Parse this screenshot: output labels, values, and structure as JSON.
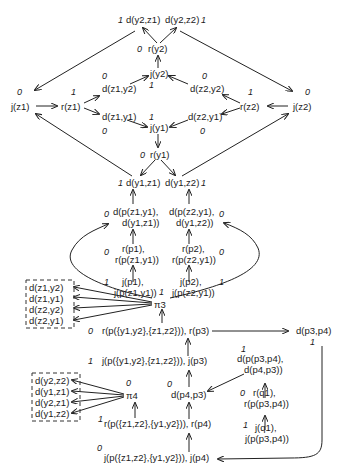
{
  "nodes": {
    "d_y2_z1": {
      "label": "d(y2,z1)",
      "value": "1"
    },
    "d_y2_z2": {
      "label": "d(y2,z2)",
      "value": "1"
    },
    "r_y2": {
      "label": "r(y2)",
      "value": "0"
    },
    "j_y2": {
      "label": "j(y2)",
      "value": "1"
    },
    "d_z1_y2": {
      "label": "d(z1,y2)",
      "value": "0"
    },
    "d_z2_y2": {
      "label": "d(z2,y2)",
      "value": "0"
    },
    "j_z1": {
      "label": "j(z1)",
      "value": "0"
    },
    "r_z1": {
      "label": "r(z1)",
      "value": "1"
    },
    "r_z2": {
      "label": "r(z2)",
      "value": "1"
    },
    "j_z2": {
      "label": "j(z2)",
      "value": "0"
    },
    "d_z1_y1": {
      "label": "d(z1,y1)",
      "value": "0"
    },
    "d_z2_y1": {
      "label": "d(z2,y1)",
      "value": "0"
    },
    "j_y1": {
      "label": "j(y1)",
      "value": "1"
    },
    "r_y1": {
      "label": "r(y1)",
      "value": "0"
    },
    "d_y1_z1": {
      "label": "d(y1,z1)",
      "value": "1"
    },
    "d_y1_z2": {
      "label": "d(y1,z2)",
      "value": "1"
    },
    "d_p_z1_y1": {
      "line1": "d(p(z1,y1),",
      "line2": "d(y1,z1))",
      "value": "0"
    },
    "d_p_z2_y1": {
      "line1": "d(p(z2,y1),",
      "line2": "d(y1,z2))",
      "value": "0"
    },
    "r_p1": {
      "line1": "r(p1),",
      "line2": "r(p(z1,y1))",
      "value": "0"
    },
    "r_p2": {
      "line1": "r(p2),",
      "line2": "r(p(z2,y1))",
      "value": "0"
    },
    "j_p1": {
      "line1": "j(p1),",
      "line2": "j(p(z1,y1))",
      "value": "1"
    },
    "j_p2": {
      "line1": "j(p2),",
      "line2": "j(p(z2,y1))",
      "value": "1"
    },
    "pi3": {
      "label": "π3",
      "value": "1"
    },
    "box1": [
      "d(z1,y2)",
      "d(z1,y1)",
      "d(z2,y2)",
      "d(z2,y1)"
    ],
    "r_p3": {
      "label": "r(p({y1,y2},{z1,z2})), r(p3)",
      "value": "0"
    },
    "d_p3_p4": {
      "label": "d(p3,p4)",
      "value": "1"
    },
    "j_p3": {
      "label": "j(p({y1,y2},{z1,z2})), j(p3)",
      "value": "1"
    },
    "d_p_p3_p4": {
      "line1": "d(p(p3,p4),",
      "line2": "d(p4,p3))",
      "value": "1"
    },
    "box2": [
      "d(y2,z2)",
      "d(y1,z1)",
      "d(y2,z1)",
      "d(y1,z2)"
    ],
    "pi4": {
      "label": "π4",
      "value": "0"
    },
    "d_p4_p3": {
      "label": "d(p4,p3)",
      "value": "0"
    },
    "r_q1": {
      "line1": "r(q1),",
      "line2": "r(p(p3,p4))",
      "value": "0"
    },
    "r_p4": {
      "label": "r(p({z1,z2},{y1,y2})), r(p4)",
      "value": "1"
    },
    "j_q1": {
      "line1": "j(q1),",
      "line2": "j(p(p3,p4))",
      "value": "1"
    },
    "j_p4": {
      "label": "j(p({z1,z2},{y1,y2})), j(p4)",
      "value": "0"
    }
  }
}
